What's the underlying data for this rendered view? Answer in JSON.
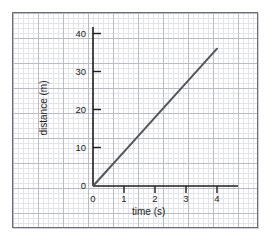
{
  "chart_data": {
    "type": "line",
    "title": "",
    "xlabel": "time (s)",
    "ylabel": "distance (m)",
    "xlim": [
      0,
      4.4
    ],
    "ylim": [
      0,
      42
    ],
    "xticks": [
      0,
      1,
      2,
      3,
      4
    ],
    "yticks": [
      0,
      10,
      20,
      30,
      40
    ],
    "xtick_labels": [
      "0",
      "1",
      "2",
      "3",
      "4"
    ],
    "ytick_labels": [
      "0",
      "10",
      "20",
      "30",
      "40"
    ],
    "grid": true,
    "grid_style": "graph-paper",
    "legend": "none",
    "series": [
      {
        "name": "distance",
        "x": [
          0,
          1,
          2,
          3,
          4
        ],
        "values": [
          0,
          9,
          18,
          27,
          36
        ],
        "color": "#54555a",
        "line_width": 2,
        "markers": "none",
        "description": "straight line through origin, slope 9 m per s"
      }
    ]
  },
  "axes": {
    "x": {
      "title": "time (s)",
      "ticks": [
        {
          "value": 0,
          "label": "0"
        },
        {
          "value": 1,
          "label": "1"
        },
        {
          "value": 2,
          "label": "2"
        },
        {
          "value": 3,
          "label": "3"
        },
        {
          "value": 4,
          "label": "4"
        }
      ]
    },
    "y": {
      "title": "distance (m)",
      "ticks": [
        {
          "value": 0,
          "label": "0"
        },
        {
          "value": 10,
          "label": "10"
        },
        {
          "value": 20,
          "label": "20"
        },
        {
          "value": 30,
          "label": "30"
        },
        {
          "value": 40,
          "label": "40"
        }
      ]
    }
  },
  "colors": {
    "line": "#54555a",
    "axis": "#1d1d1d",
    "grid_minor": "#e2e4ea",
    "grid_major": "#b9bcc4",
    "panel_border": "#6a6d73",
    "background": "#ffffff"
  }
}
